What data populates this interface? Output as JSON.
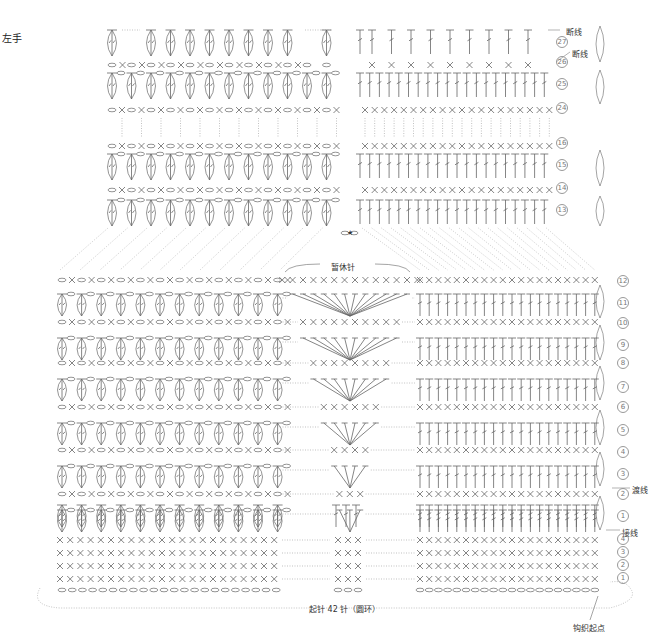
{
  "title": "",
  "hand_label": "左手",
  "labels": {
    "cut_yarn_1": "断线",
    "cut_yarn_2": "断线",
    "pause_stitches": "暂休针",
    "carry_yarn": "渡线",
    "join_yarn": "接线",
    "foundation": "起针 42 针（圆环）",
    "start_point": "钩织起点",
    "star": "★"
  },
  "upper_rows": [
    "27",
    "26",
    "25",
    "24",
    "16",
    "15",
    "14",
    "13"
  ],
  "lower_rows": [
    "12",
    "11",
    "10",
    "9",
    "8",
    "7",
    "6",
    "5",
    "4",
    "3",
    "2",
    "1"
  ],
  "base_rows": [
    "4",
    "3",
    "2",
    "1"
  ],
  "colors": {
    "line": "#666",
    "dotted": "#999",
    "text": "#333"
  }
}
